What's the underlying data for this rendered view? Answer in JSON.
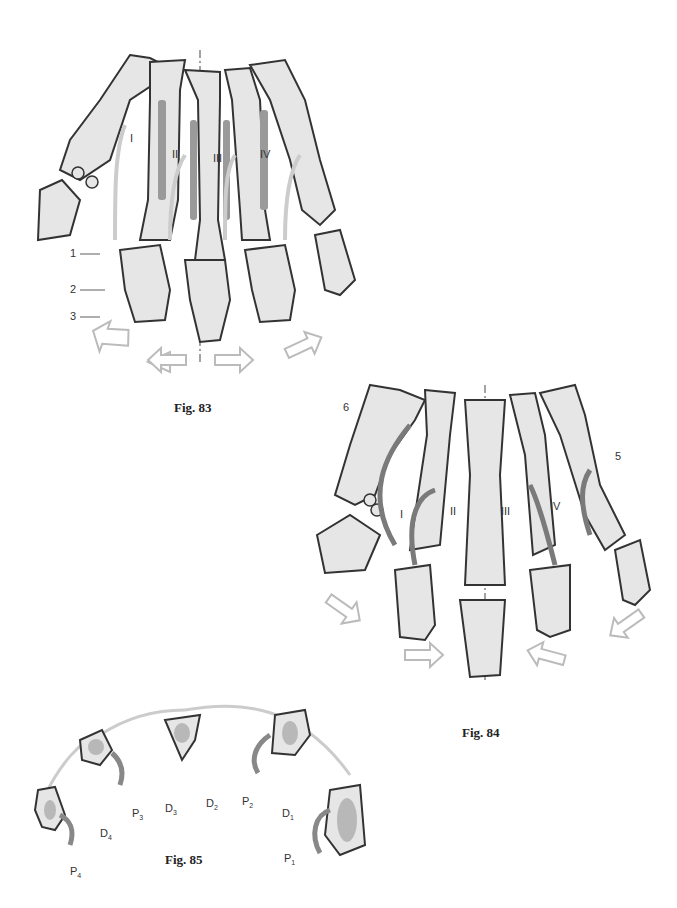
{
  "figures": {
    "fig83": {
      "caption": "Fig. 83",
      "digit_labels": [
        "I",
        "II",
        "III",
        "IV"
      ],
      "callouts": [
        "1",
        "2",
        "3"
      ]
    },
    "fig84": {
      "caption": "Fig. 84",
      "digit_labels": [
        "I",
        "II",
        "III",
        "IV"
      ],
      "callouts": [
        "5",
        "6"
      ]
    },
    "fig85": {
      "caption": "Fig. 85",
      "labels": {
        "P1": "P",
        "P1_sub": "1",
        "P2": "P",
        "P2_sub": "2",
        "P3": "P",
        "P3_sub": "3",
        "P4": "P",
        "P4_sub": "4",
        "D1": "D",
        "D1_sub": "1",
        "D2": "D",
        "D2_sub": "2",
        "D3": "D",
        "D3_sub": "3",
        "D4": "D",
        "D4_sub": "4"
      }
    }
  },
  "colors": {
    "bone_fill": "#e6e6e6",
    "bone_outline": "#333333",
    "muscle_dark": "#9a9a9a",
    "arrow_light": "#c8c8c8",
    "arrow_dark": "#7a7a7a",
    "axis_line": "#666666"
  }
}
